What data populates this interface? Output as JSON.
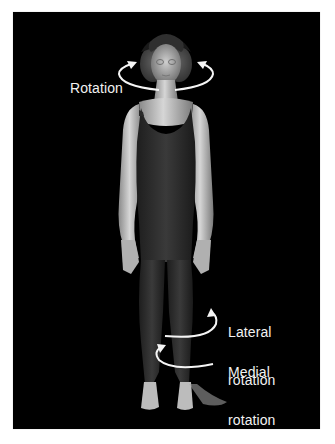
{
  "figure": {
    "background": "#000000",
    "labels": {
      "rotation": "Rotation",
      "lateral_line1": "Lateral",
      "lateral_line2": "rotation",
      "medial_line1": "Medial",
      "medial_line2": "rotation"
    },
    "arrows": [
      {
        "name": "head-rotation-arrow-left",
        "direction": "counterclockwise"
      },
      {
        "name": "head-rotation-arrow-right",
        "direction": "clockwise"
      },
      {
        "name": "lateral-rotation-arrow",
        "direction": "outward"
      },
      {
        "name": "medial-rotation-arrow",
        "direction": "inward"
      }
    ],
    "colors": {
      "panel": "#000000",
      "text": "#f2f2f2",
      "arrow": "#f5f5f5",
      "skin": "#bdbdbd",
      "suit": "#2e2e2e"
    }
  }
}
